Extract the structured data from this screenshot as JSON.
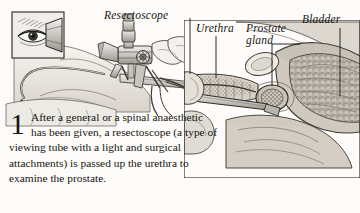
{
  "figure": {
    "type": "medical-illustration",
    "style": "grayscale pen-and-ink anatomical drawing",
    "labels": [
      {
        "id": "resectoscope",
        "text": "Resectoscope"
      },
      {
        "id": "urethra",
        "text": "Urethra"
      },
      {
        "id": "prostate",
        "text": "Prostate\ngland"
      },
      {
        "id": "bladder",
        "text": "Bladder"
      }
    ],
    "inset": {
      "name": "eye-at-eyepiece-inset"
    }
  },
  "caption": {
    "step_number": "1",
    "text": "After a general or a spinal anaesthetic has been given, a resectoscope (a type of viewing tube with a light and surgical attachments) is passed up the urethra to examine the prostate."
  },
  "colors": {
    "background": "#fdfcfa",
    "ink": "#16140f",
    "tissue_light": "#dedad2",
    "tissue_mid": "#b3ada3",
    "tissue_dark": "#8a847b",
    "cavity": "#9a958c",
    "metal": "#cfcdc8"
  }
}
